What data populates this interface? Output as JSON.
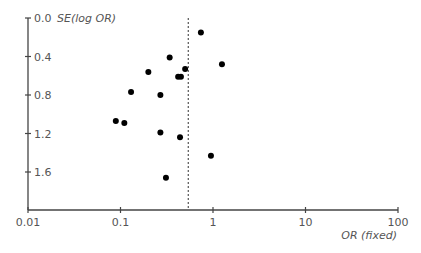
{
  "chart_data": {
    "type": "scatter",
    "subtype": "funnel-plot",
    "title": "",
    "xlabel": "OR (fixed)",
    "ylabel": "SE(log OR)",
    "x_scale": "log",
    "xlim": [
      0.01,
      100
    ],
    "ylim": [
      0.0,
      2.0
    ],
    "y_inverted": true,
    "x_ticks": [
      {
        "value": 0.01,
        "label": "0.01"
      },
      {
        "value": 0.1,
        "label": "0.1"
      },
      {
        "value": 1,
        "label": "1"
      },
      {
        "value": 10,
        "label": "10"
      },
      {
        "value": 100,
        "label": "100"
      }
    ],
    "y_ticks": [
      {
        "value": 0.0,
        "label": "0.0"
      },
      {
        "value": 0.4,
        "label": "0.4"
      },
      {
        "value": 0.8,
        "label": "0.8"
      },
      {
        "value": 1.2,
        "label": "1.2"
      },
      {
        "value": 1.6,
        "label": "1.6"
      }
    ],
    "grid": false,
    "legend": null,
    "reference_line": {
      "x": 0.54,
      "style": "dashed",
      "label": "pooled OR (fixed)"
    },
    "series": [
      {
        "name": "studies",
        "points": [
          {
            "or": 0.74,
            "se": 0.15
          },
          {
            "or": 1.25,
            "se": 0.48
          },
          {
            "or": 0.34,
            "se": 0.41
          },
          {
            "or": 0.2,
            "se": 0.56
          },
          {
            "or": 0.5,
            "se": 0.53
          },
          {
            "or": 0.42,
            "se": 0.61
          },
          {
            "or": 0.45,
            "se": 0.61
          },
          {
            "or": 0.13,
            "se": 0.77
          },
          {
            "or": 0.27,
            "se": 0.8
          },
          {
            "or": 0.089,
            "se": 1.07
          },
          {
            "or": 0.11,
            "se": 1.09
          },
          {
            "or": 0.27,
            "se": 1.19
          },
          {
            "or": 0.44,
            "se": 1.24
          },
          {
            "or": 0.95,
            "se": 1.43
          },
          {
            "or": 0.31,
            "se": 1.66
          }
        ]
      }
    ]
  }
}
